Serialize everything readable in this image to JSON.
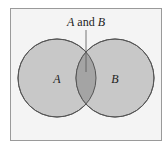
{
  "diagram": {
    "type": "venn",
    "sets": [
      {
        "label": "A",
        "color": "#c8c8c8"
      },
      {
        "label": "B",
        "color": "#c8c8c8"
      }
    ],
    "intersection": {
      "label_parts": [
        "A",
        " and ",
        "B"
      ],
      "color": "#a4a4a4"
    },
    "colors": {
      "background": "#f4f4f4",
      "border": "#9a9a9a",
      "stroke": "#555555"
    }
  }
}
